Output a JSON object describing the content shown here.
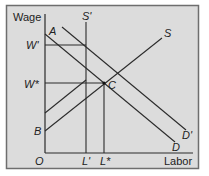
{
  "colors": {
    "background": "#dcdcdc",
    "frame": "#6e6e6e",
    "line": "#2b2b2b",
    "text": "#222222"
  },
  "axes": {
    "y_label": "Wage",
    "x_label": "Labor",
    "origin_label": "O"
  },
  "curves": {
    "demand": {
      "label": "D"
    },
    "demand_shifted": {
      "label": "D'"
    },
    "supply": {
      "label": "S"
    },
    "supply_fixed": {
      "label": "S'"
    }
  },
  "points": {
    "A": "A",
    "B": "B",
    "C": "C"
  },
  "y_ticks": {
    "w_prime": "W'",
    "w_star": "W*"
  },
  "x_ticks": {
    "l_prime": "L'",
    "l_star": "L*"
  }
}
